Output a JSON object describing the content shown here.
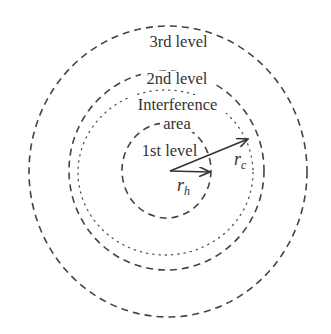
{
  "diagram": {
    "type": "concentric-levels",
    "colors": {
      "background": "#ffffff",
      "stroke": "#444444",
      "text": "#333333"
    },
    "labels": {
      "third_level": "3rd level",
      "second_level": "2nd level",
      "interference_line1": "Interference",
      "interference_line2": "area",
      "first_level": "1st level",
      "rc_main": "r",
      "rc_sub": "c",
      "rh_main": "r",
      "rh_sub": "h"
    },
    "rings": [
      {
        "name": "3rd level",
        "style": "dashed"
      },
      {
        "name": "2nd level",
        "style": "dashed"
      },
      {
        "name": "Interference area",
        "style": "dotted"
      },
      {
        "name": "1st level",
        "style": "dashed"
      }
    ],
    "arrows": [
      {
        "name": "r_c",
        "from": "center",
        "to": "interference boundary"
      },
      {
        "name": "r_h",
        "from": "center",
        "to": "1st level boundary"
      }
    ]
  }
}
